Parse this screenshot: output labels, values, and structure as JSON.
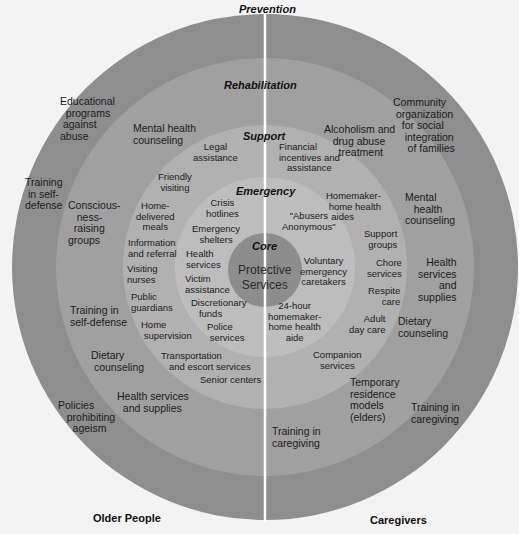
{
  "colors": {
    "background": "#f3f3f3",
    "prevention": "#8e8e8e",
    "rehabilitation": "#a0a0a0",
    "support": "#b1b1b1",
    "emergency": "#bdbdbd",
    "core": "#8d8d8d",
    "divider": "#ffffff"
  },
  "rings": {
    "prevention": "Prevention",
    "rehabilitation": "Rehabilitation",
    "support": "Support",
    "emergency": "Emergency",
    "core": "Core"
  },
  "core_label": "Protective\nServices",
  "sides": {
    "left": "Older People",
    "right": "Caregivers"
  },
  "left": {
    "prevention": [
      "Educational\n  programs\n against\nabuse",
      "Training\n in self-\ndefense",
      "Policies\n   prohibiting\n     ageism"
    ],
    "rehabilitation": [
      "Mental health\ncounseling",
      "Conscious-\n   ness-\n  raising\ngroups",
      "Training in\nself-defense",
      "Dietary\n counseling",
      "Health services\n  and supplies"
    ],
    "support": [
      "Legal\nassistance",
      "Friendly\nvisiting",
      "Home-\ndelivered\nmeals",
      "Information\nand referral",
      "Visiting\nnurses",
      "Public\nguardians",
      "Home\n supervision",
      "Transportation\n   and escort services",
      "Senior centers"
    ],
    "emergency": [
      "Crisis\nhotlines",
      "Emergency\nshelters",
      "Health\nservices",
      "Victim\nassistance",
      "Discretionary\n   funds",
      "Police\n services"
    ]
  },
  "right": {
    "prevention": [
      "Community\n organization\n   for social\n    integration\n     of families",
      "Training in\ncaregiving"
    ],
    "rehabilitation": [
      "Alcoholism and\n   drug abuse\n     treatment",
      "Mental\n   health\ncounseling",
      "Health\nservices\nand\nsupplies",
      "Dietary\ncounseling",
      "Temporary\nresidence\nmodels\n(elders)",
      "Training in\ncaregiving"
    ],
    "support": [
      "Financial\nincentives and\n   assistance",
      "Homemaker-\n home health\n  aides",
      "Support\ngroups",
      "Chore\nservices",
      "Respite\ncare",
      "Adult\nday care",
      "Companion\nservices"
    ],
    "emergency": [
      "\"Abusers\nAnonymous\"",
      "Voluntary\nemergency\ncaretakers",
      "24-hour\nhomemaker-\nhome health\naide"
    ]
  }
}
